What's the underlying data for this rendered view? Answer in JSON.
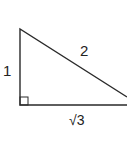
{
  "diagram": {
    "type": "right-triangle",
    "stroke_color": "#2a2a2a",
    "sides": {
      "vertical_leg": "1",
      "hypotenuse": "2",
      "horizontal_leg": "√3"
    },
    "right_angle_marker": true
  }
}
